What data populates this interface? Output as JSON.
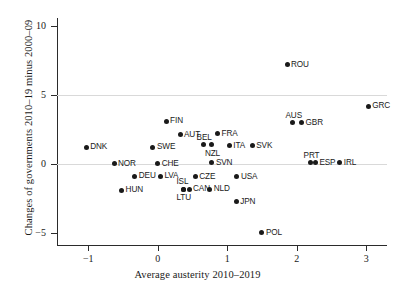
{
  "chart_data": {
    "type": "scatter",
    "title": "",
    "xlabel": "Average austerity 2010–2019",
    "ylabel": "Changes of governments 2010–19 minus 2000–09",
    "xlim": [
      -1.45,
      3.3
    ],
    "ylim": [
      -5.9,
      10.6
    ],
    "xticks": [
      -1,
      0,
      1,
      2,
      3
    ],
    "xtick_labels": [
      "−1",
      "0",
      "1",
      "2",
      "3"
    ],
    "yticks": [
      -5,
      0,
      5,
      10
    ],
    "ytick_labels": [
      "−5",
      "0",
      "5",
      "10"
    ],
    "grid": "horizontal-light",
    "gridlines_y": [
      0,
      5
    ],
    "legend": "none",
    "point_color": "#1a1a1a",
    "marker": "filled-circle",
    "points": [
      {
        "label": "DNK",
        "x": -1.03,
        "y": 1.2,
        "label_pos": "right"
      },
      {
        "label": "NOR",
        "x": -0.63,
        "y": 0.0,
        "label_pos": "right"
      },
      {
        "label": "SWE",
        "x": -0.07,
        "y": 1.2,
        "label_pos": "right"
      },
      {
        "label": "CHE",
        "x": 0.0,
        "y": 0.0,
        "label_pos": "right"
      },
      {
        "label": "DEU",
        "x": -0.33,
        "y": -0.9,
        "label_pos": "right"
      },
      {
        "label": "LVA",
        "x": 0.04,
        "y": -0.9,
        "label_pos": "right"
      },
      {
        "label": "HUN",
        "x": -0.52,
        "y": -1.9,
        "label_pos": "right"
      },
      {
        "label": "FIN",
        "x": 0.12,
        "y": 3.1,
        "label_pos": "right"
      },
      {
        "label": "AUT",
        "x": 0.32,
        "y": 2.1,
        "label_pos": "right"
      },
      {
        "label": "FRA",
        "x": 0.86,
        "y": 2.2,
        "label_pos": "right"
      },
      {
        "label": "BEL",
        "x": 0.66,
        "y": 1.4,
        "label_pos": "above"
      },
      {
        "label": "NZL",
        "x": 0.78,
        "y": 1.4,
        "label_pos": "below"
      },
      {
        "label": "ITA",
        "x": 1.03,
        "y": 1.3,
        "label_pos": "right"
      },
      {
        "label": "SVK",
        "x": 1.36,
        "y": 1.3,
        "label_pos": "right"
      },
      {
        "label": "SVN",
        "x": 0.78,
        "y": 0.1,
        "label_pos": "right"
      },
      {
        "label": "CZE",
        "x": 0.54,
        "y": -0.95,
        "label_pos": "right"
      },
      {
        "label": "USA",
        "x": 1.14,
        "y": -0.95,
        "label_pos": "right"
      },
      {
        "label": "ISL",
        "x": 0.37,
        "y": -1.85,
        "label_pos": "above"
      },
      {
        "label": "CAN",
        "x": 0.45,
        "y": -1.85,
        "label_pos": "right"
      },
      {
        "label": "LTU",
        "x": 0.37,
        "y": -1.85,
        "label_pos": "below"
      },
      {
        "label": "NLD",
        "x": 0.75,
        "y": -1.85,
        "label_pos": "right"
      },
      {
        "label": "JPN",
        "x": 1.13,
        "y": -2.75,
        "label_pos": "right"
      },
      {
        "label": "POL",
        "x": 1.5,
        "y": -5.0,
        "label_pos": "right"
      },
      {
        "label": "ROU",
        "x": 1.86,
        "y": 7.2,
        "label_pos": "right"
      },
      {
        "label": "AUS",
        "x": 1.94,
        "y": 3.0,
        "label_pos": "above"
      },
      {
        "label": "GBR",
        "x": 2.07,
        "y": 3.0,
        "label_pos": "right"
      },
      {
        "label": "GRC",
        "x": 3.03,
        "y": 4.2,
        "label_pos": "right"
      },
      {
        "label": "PRT",
        "x": 2.2,
        "y": 0.1,
        "label_pos": "above"
      },
      {
        "label": "ESP",
        "x": 2.27,
        "y": 0.1,
        "label_pos": "right"
      },
      {
        "label": "IRL",
        "x": 2.62,
        "y": 0.1,
        "label_pos": "right"
      }
    ]
  }
}
